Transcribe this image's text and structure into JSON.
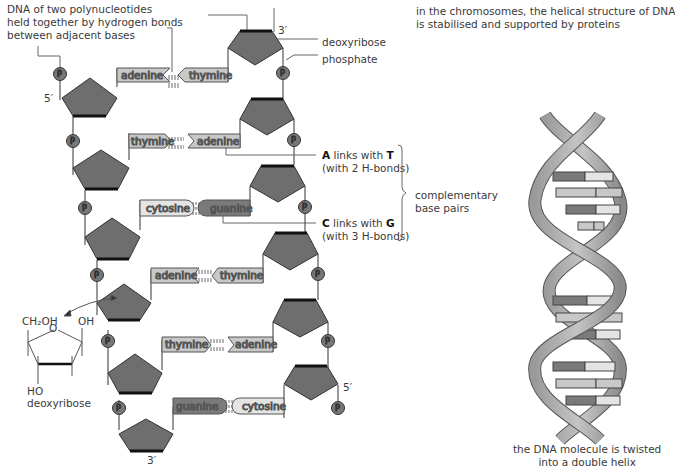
{
  "annotations": {
    "polynucleotides": [
      "DNA of two polynucleotides",
      "held together by hydrogen bonds",
      "between adjacent bases"
    ],
    "deoxyribose": "deoxyribose",
    "phosphate": "phosphate",
    "chromosomes": [
      "in the chromosomes, the helical structure of DNA",
      "is stabilised and supported by proteins"
    ],
    "at_link": {
      "a": "A",
      "links": " links with ",
      "t": "T",
      "bonds": "(with 2 H-bonds)"
    },
    "cg_link": {
      "c": "C",
      "links": " links with ",
      "g": "G",
      "bonds": "(with 3 H-bonds)"
    },
    "complementary": [
      "complementary",
      "base pairs"
    ],
    "helix_caption": [
      "the DNA molecule is twisted",
      "into a double helix"
    ],
    "sugar_structure": {
      "ch2oh": "CH₂OH",
      "oh": "OH",
      "o": "O",
      "ho": "HO",
      "name": "deoxyribose"
    }
  },
  "strand_ends": {
    "left_top": "5′",
    "left_bottom": "3′",
    "right_top": "3′",
    "right_bottom": "5′"
  },
  "phosphate_symbol": "Pi",
  "base_pairs": [
    {
      "left": "adenine",
      "right": "thymine",
      "bond": "2"
    },
    {
      "left": "thymine",
      "right": "adenine",
      "bond": "2"
    },
    {
      "left": "cytosine",
      "right": "guanine",
      "bond": "3"
    },
    {
      "left": "adenine",
      "right": "thymine",
      "bond": "2"
    },
    {
      "left": "thymine",
      "right": "adenine",
      "bond": "2"
    },
    {
      "left": "guanine",
      "right": "cytosine",
      "bond": "3"
    }
  ],
  "colors": {
    "sugar": "#6e6e6e",
    "sugar_edge": "#111111",
    "purine_light": "#c8c8c8",
    "pyrimidine_light": "#e4e4e4",
    "guanine": "#7a7a7a",
    "phosphate": "#777777",
    "line": "#555555"
  }
}
